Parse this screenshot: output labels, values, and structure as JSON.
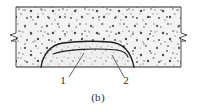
{
  "figure": {
    "caption": "(b)",
    "type": "engineering-cross-section-diagram",
    "background_color": "#ffffff",
    "fill_color": "#f2f2f2",
    "line_color": "#2b2b2b",
    "speckle_color": "#555555",
    "callouts": [
      {
        "id": "1",
        "label": "1",
        "label_x": 63,
        "label_y": 84,
        "leader_from_x": 69,
        "leader_from_y": 77,
        "leader_to_x": 84,
        "leader_to_y": 53
      },
      {
        "id": "2",
        "label": "2",
        "label_x": 126,
        "label_y": 84,
        "leader_from_x": 124,
        "leader_from_y": 77,
        "leader_to_x": 112,
        "leader_to_y": 55
      }
    ],
    "boundaries": {
      "top_line_y": 7,
      "bottom_line_y": 67,
      "left_edge_x": 16,
      "right_edge_x": 181
    },
    "break_symbols": [
      {
        "side": "left",
        "x": 16,
        "y": 37
      },
      {
        "side": "right",
        "x": 181,
        "y": 37
      }
    ],
    "dome": {
      "outer_path": "M 41 67 C 43 55 50 45 63 43 C 78 41 96 41 110 42 C 124 43 131 52 134 67",
      "inner_path": "M 53 54 C 66 49 96 48 117 50 C 124 51 127 54 128 57"
    }
  }
}
